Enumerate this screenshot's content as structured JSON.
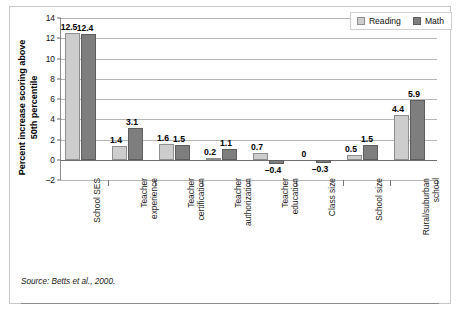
{
  "chart_data": {
    "type": "bar",
    "title": "",
    "xlabel": "",
    "ylabel": "Percent increase scoring above 50th percentile",
    "ylabel_line1": "Percent increase scoring above",
    "ylabel_line2": "50th percentile",
    "ylim": [
      -2,
      14
    ],
    "ytick_step": 2,
    "yticks": [
      14,
      12,
      10,
      8,
      6,
      4,
      2,
      0,
      -2
    ],
    "ytick_labels": [
      "14",
      "12",
      "10",
      "8",
      "6",
      "4",
      "2",
      "0",
      "–2"
    ],
    "grid": true,
    "legend_position": "top-right",
    "categories": [
      "School SES",
      "Teacher experience",
      "Teacher certification",
      "Teacher authorization",
      "Teacher education",
      "Class size",
      "School size",
      "Rural/suburban school"
    ],
    "category_lines": [
      [
        "School SES",
        ""
      ],
      [
        "Teacher",
        "experience"
      ],
      [
        "Teacher",
        "certification"
      ],
      [
        "Teacher",
        "authorization"
      ],
      [
        "Teacher",
        "education"
      ],
      [
        "Class size",
        ""
      ],
      [
        "School size",
        ""
      ],
      [
        "Rural/suburban",
        "school"
      ]
    ],
    "series": [
      {
        "name": "Reading",
        "color": "#cdcdcd",
        "values": [
          12.5,
          1.4,
          1.6,
          0.2,
          0.7,
          0,
          0.5,
          4.4
        ],
        "labels": [
          "12.5",
          "1.4",
          "1.6",
          "0.2",
          "0.7",
          "0",
          "0.5",
          "4.4"
        ]
      },
      {
        "name": "Math",
        "color": "#7e7e7e",
        "values": [
          12.4,
          3.1,
          1.5,
          1.1,
          -0.4,
          -0.3,
          1.5,
          5.9
        ],
        "labels": [
          "12.4",
          "3.1",
          "1.5",
          "1.1",
          "–0.4",
          "–0.3",
          "1.5",
          "5.9"
        ]
      }
    ]
  },
  "legend": {
    "items": [
      {
        "label": "Reading",
        "swatch": "reading-swatch"
      },
      {
        "label": "Math",
        "swatch": "math-swatch"
      }
    ]
  },
  "source": {
    "text": "Source: Betts et al., 2000."
  },
  "colors": {
    "reading": "#cdcdcd",
    "math": "#7e7e7e",
    "grid": "#b5b5b5",
    "axis": "#6e6e6e",
    "frame": "#c9c9c9"
  }
}
